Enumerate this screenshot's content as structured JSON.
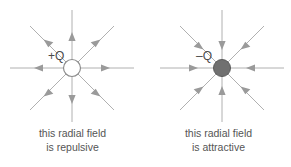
{
  "figure": {
    "background_color": "#ffffff",
    "field_line_color": "#a9a9a9",
    "arrow_color": "#a0a0a0",
    "label_color": "#4a4a4a",
    "caption_color": "#555555"
  },
  "panels": [
    {
      "id": "repulsive",
      "charge_label": "+Q",
      "charge_sign": "positive",
      "charge_fill": "#ffffff",
      "charge_stroke": "#8c8c8c",
      "field_direction": "outward",
      "caption_line_1": "this radial field",
      "caption_line_2": "is repulsive"
    },
    {
      "id": "attractive",
      "charge_label": "–Q",
      "charge_sign": "negative",
      "charge_fill": "#707070",
      "charge_stroke": "#5a5a5a",
      "field_direction": "inward",
      "caption_line_1": "this radial field",
      "caption_line_2": "is attractive"
    }
  ]
}
